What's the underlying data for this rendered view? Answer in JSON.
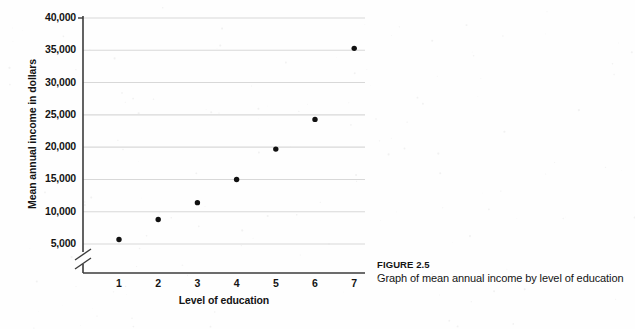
{
  "figure": {
    "caption_title": "FIGURE 2.5",
    "caption_text": "Graph of mean annual income by level of education"
  },
  "chart_data": {
    "type": "scatter",
    "title": "Graph of mean annual income by level of education",
    "xlabel": "Level of education",
    "ylabel": "Mean annual income in dollars",
    "x": [
      1,
      2,
      3,
      4,
      5,
      6,
      7
    ],
    "values": [
      5700,
      8800,
      11400,
      15000,
      19700,
      24300,
      35300
    ],
    "categories": [
      "1",
      "2",
      "3",
      "4",
      "5",
      "6",
      "7"
    ],
    "xlim": [
      0.45,
      7.4
    ],
    "ylim": [
      3400,
      40000
    ],
    "xtick_labels": [
      "1",
      "2",
      "3",
      "4",
      "5",
      "6",
      "7"
    ],
    "ytick_labels": [
      "5,000",
      "10,000",
      "15,000",
      "20,000",
      "25,000",
      "30,000",
      "35,000",
      "40,000"
    ],
    "ytick_values": [
      5000,
      10000,
      15000,
      20000,
      25000,
      30000,
      35000,
      40000
    ],
    "grid": "horizontal",
    "legend": "none",
    "y_axis_break": true,
    "marker_color": "#111111",
    "gridline_color": "#d8d8d8",
    "axis_color": "#3b3b3b"
  }
}
